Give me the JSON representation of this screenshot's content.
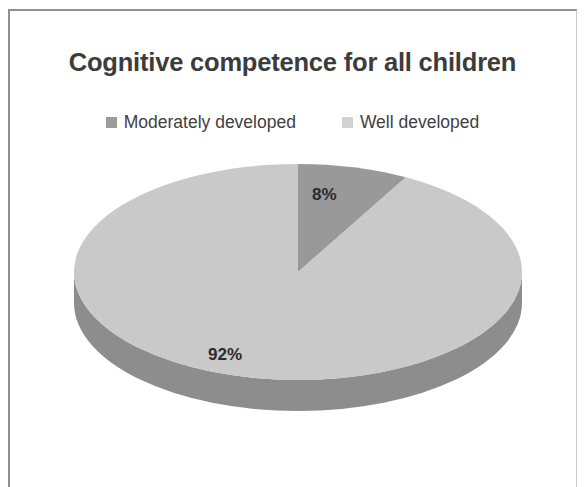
{
  "chart_data": {
    "type": "pie",
    "title": "Cognitive competence for all children",
    "categories": [
      "Moderately developed",
      "Well developed"
    ],
    "values": [
      8,
      92
    ],
    "value_labels": [
      "8%",
      "92%"
    ],
    "colors": [
      "#9b9b9b",
      "#cccccc"
    ],
    "side_colors": [
      "#6f6f6f",
      "#8f8f8f"
    ],
    "legend_position": "top",
    "three_d": true,
    "start_angle_deg": 0,
    "grid": false,
    "xlabel": "",
    "ylabel": ""
  },
  "title": {
    "text": "Cognitive competence for all children"
  },
  "legend": {
    "items": [
      {
        "label": "Moderately developed",
        "color": "#9b9b9b"
      },
      {
        "label": "Well developed",
        "color": "#d2d2d2"
      }
    ]
  },
  "slices": [
    {
      "label": "8%",
      "name": "Moderately developed",
      "value": 8
    },
    {
      "label": "92%",
      "name": "Well developed",
      "value": 92
    }
  ],
  "colors": {
    "title_text": "#3c3c3c",
    "label_text": "#2b2b2b",
    "background": "#ffffff",
    "frame": "#8e8e8e"
  }
}
